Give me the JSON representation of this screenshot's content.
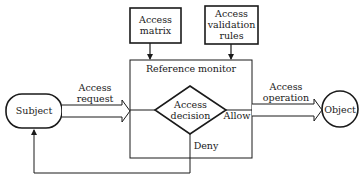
{
  "diagram": {
    "nodes": {
      "access_matrix": {
        "label_line1": "Access",
        "label_line2": "matrix"
      },
      "access_validation_rules": {
        "label_line1": "Access",
        "label_line2": "validation",
        "label_line3": "rules"
      },
      "reference_monitor": {
        "label": "Reference monitor"
      },
      "access_decision": {
        "label_line1": "Access",
        "label_line2": "decision"
      },
      "subject": {
        "label": "Subject"
      },
      "object": {
        "label": "Object"
      }
    },
    "edges": {
      "access_request": {
        "label_line1": "Access",
        "label_line2": "request"
      },
      "access_operation": {
        "label_line1": "Access",
        "label_line2": "operation"
      },
      "allow": {
        "label": "Allow"
      },
      "deny": {
        "label": "Deny"
      }
    },
    "colors": {
      "stroke": "#1a1a1a",
      "background": "#ffffff"
    }
  }
}
